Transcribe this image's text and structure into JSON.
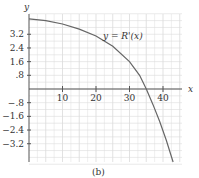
{
  "chart_data": {
    "type": "line",
    "title": "",
    "caption": "(b)",
    "xlabel": "x",
    "ylabel": "y",
    "curve_label": "y = R'(x)",
    "xlim": [
      0,
      45
    ],
    "ylim": [
      -4.2,
      4.4
    ],
    "x_ticks": [
      "10",
      "20",
      "30",
      "40"
    ],
    "y_ticks": [
      "3.2",
      "2.4",
      "1.6",
      ".8",
      "-.8",
      "-1.6",
      "-2.4",
      "-3.2"
    ],
    "grid": true,
    "series": [
      {
        "name": "R'(x)",
        "x": [
          0,
          5,
          10,
          15,
          20,
          25,
          30,
          33,
          35,
          37,
          39,
          41,
          43
        ],
        "y": [
          4.1,
          4.0,
          3.8,
          3.5,
          3.1,
          2.5,
          1.6,
          0.8,
          0.0,
          -0.9,
          -1.9,
          -3.0,
          -4.3
        ]
      }
    ]
  }
}
